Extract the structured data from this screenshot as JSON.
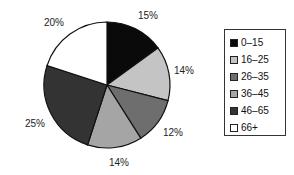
{
  "chart_data": {
    "type": "pie",
    "title": "",
    "categories": [
      "0–15",
      "16–25",
      "26–35",
      "36–45",
      "46–65",
      "66+"
    ],
    "values": [
      15,
      14,
      12,
      14,
      25,
      20
    ],
    "labels": [
      "15%",
      "14%",
      "12%",
      "14%",
      "25%",
      "20%"
    ],
    "colors": [
      "#0a0a0a",
      "#c4c4c4",
      "#6e6e6e",
      "#a5a5a5",
      "#333333",
      "#ffffff"
    ],
    "start_angle": "12 o'clock",
    "direction": "clockwise",
    "legend_position": "right"
  },
  "legend": {
    "items": [
      {
        "label": "0–15",
        "color": "#0a0a0a"
      },
      {
        "label": "16–25",
        "color": "#c4c4c4"
      },
      {
        "label": "26–35",
        "color": "#6e6e6e"
      },
      {
        "label": "36–45",
        "color": "#a5a5a5"
      },
      {
        "label": "46–65",
        "color": "#333333"
      },
      {
        "label": "66+",
        "color": "#ffffff"
      }
    ]
  },
  "slice_labels": [
    "15%",
    "14%",
    "12%",
    "14%",
    "25%",
    "20%"
  ]
}
